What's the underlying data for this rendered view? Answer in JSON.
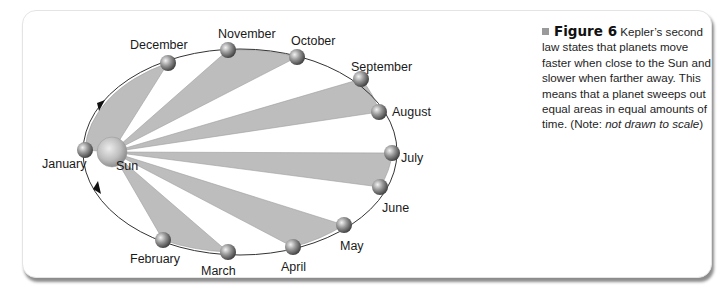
{
  "figure": {
    "number_label": "Figure 6",
    "caption_text": "Kepler’s second law states that planets move faster when close to the Sun and slower when farther away. This means that a planet sweeps out equal areas in equal amounts of time. (Note: ",
    "caption_note_italic": "not drawn to scale",
    "caption_end": ")"
  },
  "diagram": {
    "sun_label": "Sun",
    "months": [
      {
        "name": "January",
        "x": 85,
        "y": 150
      },
      {
        "name": "February",
        "x": 163,
        "y": 240
      },
      {
        "name": "March",
        "x": 228,
        "y": 252
      },
      {
        "name": "April",
        "x": 293,
        "y": 247
      },
      {
        "name": "May",
        "x": 344,
        "y": 225
      },
      {
        "name": "June",
        "x": 380,
        "y": 187
      },
      {
        "name": "July",
        "x": 392,
        "y": 153
      },
      {
        "name": "August",
        "x": 379,
        "y": 112
      },
      {
        "name": "September",
        "x": 361,
        "y": 79
      },
      {
        "name": "October",
        "x": 297,
        "y": 57
      },
      {
        "name": "November",
        "x": 228,
        "y": 50
      },
      {
        "name": "December",
        "x": 168,
        "y": 63
      }
    ],
    "swept_areas": [
      [
        "December",
        "January"
      ],
      [
        "October",
        "November"
      ],
      [
        "August",
        "September"
      ],
      [
        "June",
        "July"
      ],
      [
        "April",
        "May"
      ],
      [
        "February",
        "March"
      ]
    ],
    "colors": {
      "swept_fill": "#bdbdbd",
      "orbit_stroke": "#333333",
      "caption_bullet": "#9a9a9a"
    }
  }
}
